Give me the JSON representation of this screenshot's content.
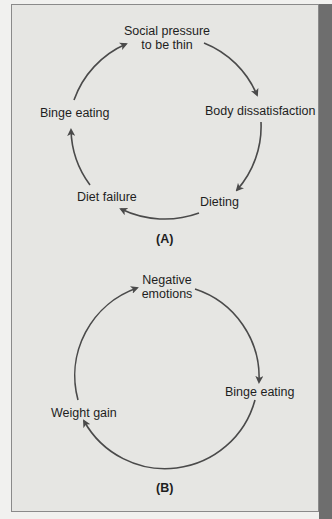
{
  "diagram_a": {
    "caption": "(A)",
    "nodes": [
      {
        "id": "social",
        "line1": "Social pressure",
        "line2": "to be thin"
      },
      {
        "id": "body",
        "label": "Body dissatisfaction"
      },
      {
        "id": "dieting",
        "label": "Dieting"
      },
      {
        "id": "diet_failure",
        "label": "Diet failure"
      },
      {
        "id": "binge",
        "label": "Binge eating"
      }
    ],
    "cycle": [
      "Social pressure to be thin",
      "Body dissatisfaction",
      "Dieting",
      "Diet failure",
      "Binge eating"
    ]
  },
  "diagram_b": {
    "caption": "(B)",
    "nodes": [
      {
        "id": "negative",
        "line1": "Negative",
        "line2": "emotions"
      },
      {
        "id": "binge",
        "label": "Binge eating"
      },
      {
        "id": "weight",
        "label": "Weight gain"
      }
    ],
    "cycle": [
      "Negative emotions",
      "Binge eating",
      "Weight gain"
    ]
  },
  "colors": {
    "arrow": "#4a4a4a",
    "text": "#1e1e1e",
    "panel": "#e6e6e3"
  }
}
